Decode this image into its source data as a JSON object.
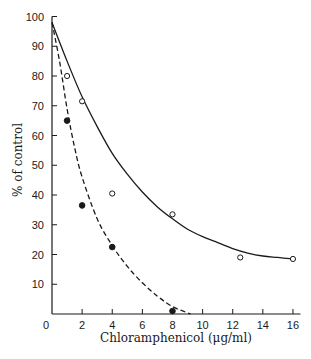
{
  "chart_data": {
    "type": "scatter",
    "title": "",
    "xlabel": "Chloramphenicol (μg/ml)",
    "ylabel": "% of control",
    "xlim": [
      0,
      16.5
    ],
    "ylim": [
      0,
      100
    ],
    "x_ticks": [
      0,
      2,
      4,
      6,
      8,
      10,
      12,
      14,
      16
    ],
    "y_ticks": [
      10,
      20,
      30,
      40,
      50,
      60,
      70,
      80,
      90,
      100
    ],
    "grid": false,
    "legend": null,
    "series": [
      {
        "name": "open circles",
        "marker": "open-circle",
        "line": "solid",
        "points": [
          [
            1,
            80
          ],
          [
            2,
            71.5
          ],
          [
            4,
            40.5
          ],
          [
            8,
            33.5
          ],
          [
            12.5,
            19
          ],
          [
            16,
            18.5
          ]
        ],
        "curve": [
          [
            0,
            98
          ],
          [
            1,
            85
          ],
          [
            2,
            73
          ],
          [
            3,
            63
          ],
          [
            4,
            54
          ],
          [
            5,
            47
          ],
          [
            6,
            41
          ],
          [
            7,
            36
          ],
          [
            8,
            32
          ],
          [
            9,
            28.5
          ],
          [
            10,
            26
          ],
          [
            11,
            24
          ],
          [
            12,
            22
          ],
          [
            13,
            20.5
          ],
          [
            14,
            19.5
          ],
          [
            15,
            19
          ],
          [
            16,
            18.5
          ]
        ]
      },
      {
        "name": "filled circles",
        "marker": "filled-circle",
        "line": "dashed",
        "points": [
          [
            1,
            65
          ],
          [
            2,
            36.5
          ],
          [
            4,
            22.5
          ],
          [
            8,
            1
          ]
        ],
        "curve": [
          [
            0,
            98
          ],
          [
            0.5,
            85
          ],
          [
            1,
            69
          ],
          [
            1.5,
            56
          ],
          [
            2,
            46
          ],
          [
            3,
            32
          ],
          [
            4,
            23
          ],
          [
            5,
            16
          ],
          [
            6,
            10.5
          ],
          [
            7,
            6
          ],
          [
            8,
            2.5
          ],
          [
            9.2,
            0
          ]
        ]
      }
    ]
  },
  "axes": {
    "x_label": "Chloramphenicol (μg/ml)",
    "y_label": "% of control",
    "origin_label": "0",
    "x_tick_labels": [
      "2",
      "4",
      "6",
      "8",
      "10",
      "12",
      "14",
      "16"
    ],
    "y_tick_labels": [
      "10",
      "20",
      "30",
      "40",
      "50",
      "60",
      "70",
      "80",
      "90",
      "100"
    ]
  }
}
